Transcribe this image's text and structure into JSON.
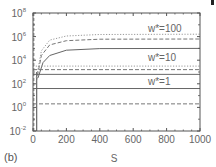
{
  "chart_data": {
    "type": "line",
    "title": "",
    "panel_label": "(b)",
    "xlabel": "S",
    "ylabel": "",
    "xlim": [
      0,
      1000
    ],
    "ylim_log10": [
      -2,
      8
    ],
    "yscale": "log",
    "grid": false,
    "x_ticks": [
      "0",
      "200",
      "400",
      "600",
      "800",
      "1000"
    ],
    "y_ticks": [
      {
        "base": "10",
        "exp": "8"
      },
      {
        "base": "10",
        "exp": "6"
      },
      {
        "base": "10",
        "exp": "4"
      },
      {
        "base": "10",
        "exp": "2"
      },
      {
        "base": "10",
        "exp": "0"
      },
      {
        "base": "10",
        "exp": "-2"
      }
    ],
    "annotations": [
      {
        "text": "w*=100",
        "x": 700,
        "y_log10": 6.6
      },
      {
        "text": "w*=10",
        "x": 700,
        "y_log10": 4.2
      },
      {
        "text": "w*=1",
        "x": 700,
        "y_log10": 2.3
      }
    ],
    "series": [
      {
        "name": "w*=100 dotted",
        "style": "dotted",
        "plateau_log10": 6.2,
        "x": [
          20,
          50,
          100,
          200,
          400,
          1000
        ],
        "y_log10": [
          2.5,
          4.8,
          5.7,
          6.05,
          6.18,
          6.2
        ]
      },
      {
        "name": "w*=100 dashed",
        "style": "dashed",
        "plateau_log10": 5.8,
        "x": [
          20,
          50,
          100,
          200,
          400,
          1000
        ],
        "y_log10": [
          2.2,
          4.4,
          5.3,
          5.65,
          5.78,
          5.8
        ]
      },
      {
        "name": "w*=100 solid",
        "style": "solid",
        "plateau_log10": 5.0,
        "x": [
          30,
          60,
          100,
          200,
          400,
          1000
        ],
        "y_log10": [
          2.5,
          3.8,
          4.4,
          4.85,
          4.98,
          5.0
        ]
      },
      {
        "name": "w*=10 dotted",
        "style": "dotted",
        "plateau_log10": 3.5,
        "x": [
          0,
          1000
        ],
        "y_log10": [
          3.5,
          3.5
        ]
      },
      {
        "name": "w*=10 dashed",
        "style": "dashed",
        "plateau_log10": 3.2,
        "x": [
          0,
          1000
        ],
        "y_log10": [
          3.2,
          3.2
        ]
      },
      {
        "name": "w*=10 solid",
        "style": "solid",
        "plateau_log10": 2.8,
        "x": [
          0,
          1000
        ],
        "y_log10": [
          2.8,
          2.8
        ]
      },
      {
        "name": "w*=1 solid",
        "style": "solid",
        "plateau_log10": 1.6,
        "x": [
          0,
          1000
        ],
        "y_log10": [
          1.6,
          1.6
        ]
      },
      {
        "name": "w*=1 dashed",
        "style": "dashed",
        "plateau_log10": 0.3,
        "x": [
          0,
          1000
        ],
        "y_log10": [
          0.3,
          0.3
        ]
      }
    ]
  }
}
